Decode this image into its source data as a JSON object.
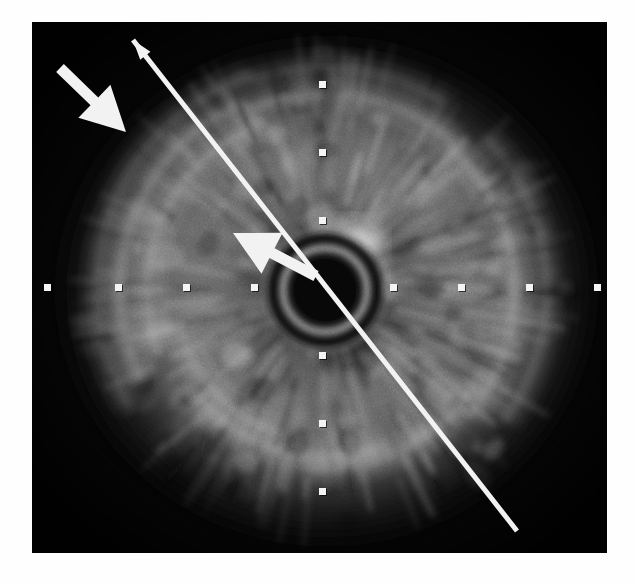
{
  "figure": {
    "modality": "intravascular-ultrasound",
    "view": "cross-sectional-gray-scale",
    "frame": {
      "x": 32,
      "y": 22,
      "width": 575,
      "height": 531,
      "background_color": "#0a0a0a",
      "page_background_color": "#ffffff"
    },
    "center": {
      "x": 325,
      "y": 290
    },
    "catheter": {
      "label": "imaging-catheter-ring-artifact",
      "center_x": 325,
      "center_y": 290,
      "outer_radius": 46,
      "inner_radius": 38,
      "ring_color": "#9a9a9a"
    }
  },
  "scale_ticks": {
    "color": "#f4f4f4",
    "size_px": 7,
    "spacing_px": 68,
    "horizontal": [
      {
        "name": "tick-left-4",
        "x": 47,
        "y": 287
      },
      {
        "name": "tick-left-3",
        "x": 118,
        "y": 287
      },
      {
        "name": "tick-left-2",
        "x": 186,
        "y": 287
      },
      {
        "name": "tick-left-1",
        "x": 254,
        "y": 287
      },
      {
        "name": "tick-right-1",
        "x": 393,
        "y": 287
      },
      {
        "name": "tick-right-2",
        "x": 461,
        "y": 287
      },
      {
        "name": "tick-right-3",
        "x": 529,
        "y": 287
      },
      {
        "name": "tick-right-4",
        "x": 597,
        "y": 287
      }
    ],
    "vertical": [
      {
        "name": "tick-up-3",
        "x": 322,
        "y": 84
      },
      {
        "name": "tick-up-2",
        "x": 322,
        "y": 152
      },
      {
        "name": "tick-up-1",
        "x": 322,
        "y": 220
      },
      {
        "name": "tick-down-1",
        "x": 322,
        "y": 355
      },
      {
        "name": "tick-down-2",
        "x": 322,
        "y": 423
      },
      {
        "name": "tick-down-3",
        "x": 322,
        "y": 491
      }
    ]
  },
  "annotations": {
    "color": "#f2f2f2",
    "items": [
      {
        "name": "arrow-plaque-outer",
        "type": "block-arrow",
        "tail_x": 60,
        "tail_y": 68,
        "tip_x": 126,
        "tip_y": 132,
        "shaft_width": 11,
        "head_width": 46,
        "head_length": 44,
        "points_to": "eccentric-plaque-outer-wall"
      },
      {
        "name": "arrow-plaque-inner",
        "type": "block-arrow",
        "tail_x": 316,
        "tail_y": 276,
        "tip_x": 233,
        "tip_y": 233,
        "shaft_width": 11,
        "head_width": 46,
        "head_length": 44,
        "points_to": "intimal-thickening-near-lumen"
      },
      {
        "name": "measurement-axis-line",
        "type": "double-line-with-arrowhead",
        "start_x": 133,
        "start_y": 40,
        "end_x": 517,
        "end_y": 531,
        "line_width": 5,
        "arrowhead_at": "start",
        "arrowhead_width": 13,
        "arrowhead_length": 20,
        "describes": "maximum-vessel-diameter-axis"
      }
    ]
  },
  "tissue": {
    "description": "concentric echogenic vessel-wall arcs with radial speckle",
    "bright_arc_color": "#cfcfcf",
    "mid_tissue_color": "#787878",
    "dark_lumen_color": "#121212",
    "bright_focus": {
      "name": "calcific-bright-spot",
      "x": 360,
      "y": 243,
      "radius": 18
    },
    "arcs": [
      {
        "name": "arc-outer-upper-left",
        "cx": 325,
        "cy": 290,
        "r": 228,
        "start_deg": 150,
        "end_deg": 250,
        "intensity": 0.55
      },
      {
        "name": "arc-upper-left-bright",
        "cx": 325,
        "cy": 290,
        "r": 205,
        "start_deg": 155,
        "end_deg": 245,
        "intensity": 0.85
      },
      {
        "name": "arc-upper-left-inner",
        "cx": 325,
        "cy": 290,
        "r": 178,
        "start_deg": 160,
        "end_deg": 248,
        "intensity": 0.62
      },
      {
        "name": "arc-top",
        "cx": 325,
        "cy": 290,
        "r": 196,
        "start_deg": 248,
        "end_deg": 310,
        "intensity": 0.72
      },
      {
        "name": "arc-top-outer",
        "cx": 325,
        "cy": 290,
        "r": 222,
        "start_deg": 252,
        "end_deg": 302,
        "intensity": 0.5
      },
      {
        "name": "arc-right",
        "cx": 325,
        "cy": 290,
        "r": 190,
        "start_deg": 312,
        "end_deg": 40,
        "intensity": 0.78
      },
      {
        "name": "arc-right-outer",
        "cx": 325,
        "cy": 290,
        "r": 222,
        "start_deg": 318,
        "end_deg": 35,
        "intensity": 0.55
      },
      {
        "name": "arc-lower-right",
        "cx": 325,
        "cy": 290,
        "r": 178,
        "start_deg": 35,
        "end_deg": 95,
        "intensity": 0.6
      },
      {
        "name": "arc-bottom",
        "cx": 325,
        "cy": 290,
        "r": 166,
        "start_deg": 70,
        "end_deg": 140,
        "intensity": 0.66
      },
      {
        "name": "arc-lower-left",
        "cx": 325,
        "cy": 290,
        "r": 150,
        "start_deg": 110,
        "end_deg": 165,
        "intensity": 0.6
      },
      {
        "name": "arc-mid-ring",
        "cx": 325,
        "cy": 290,
        "r": 120,
        "start_deg": 0,
        "end_deg": 360,
        "intensity": 0.45
      },
      {
        "name": "arc-peri-lumen",
        "cx": 325,
        "cy": 290,
        "r": 74,
        "start_deg": 0,
        "end_deg": 360,
        "intensity": 0.5
      }
    ]
  }
}
